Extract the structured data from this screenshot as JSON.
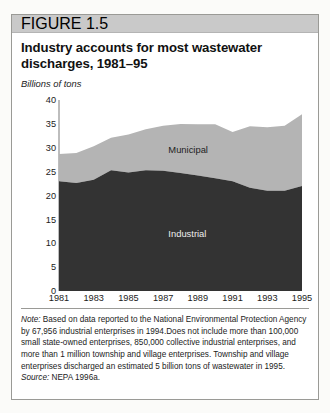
{
  "figure": {
    "band_label": "FIGURE 1.5",
    "title": "Industry accounts for most wastewater discharges, 1981–95",
    "axis_unit": "Billions of tons"
  },
  "footnote": {
    "note_label": "Note:",
    "note_text": " Based on data reported to the National Environmental Protection Agency by 67,956 industrial enterprises in 1994.Does not include more than 100,000 small state-owned enterprises, 850,000 collective industrial enterprises, and more than 1 million township and village enterprises. Township and village enterprises discharged an estimated 5 billion tons of wastewater in 1995.",
    "source_label": "Source:",
    "source_text": " NEPA 1996a."
  },
  "colors": {
    "industrial": "#333333",
    "municipal": "#b4b4b4",
    "band": "#c9c9c9",
    "axis": "#bdbdbd",
    "border": "#9a9a96"
  },
  "chart_data": {
    "type": "area",
    "stacked": true,
    "title": "Industry accounts for most wastewater discharges, 1981–95",
    "xlabel": "",
    "ylabel": "Billions of tons",
    "ylim": [
      0,
      40
    ],
    "yticks": [
      0,
      5,
      10,
      15,
      20,
      25,
      30,
      35,
      40
    ],
    "xlim": [
      1981,
      1995
    ],
    "xticks": [
      1981,
      1983,
      1985,
      1987,
      1989,
      1991,
      1993,
      1995
    ],
    "x": [
      1981,
      1982,
      1983,
      1984,
      1985,
      1986,
      1987,
      1988,
      1989,
      1990,
      1991,
      1992,
      1993,
      1994,
      1995
    ],
    "grid": false,
    "legend_position": "inline",
    "series": [
      {
        "name": "Industrial",
        "color": "#333333",
        "values": [
          23.0,
          22.6,
          23.3,
          25.3,
          24.8,
          25.3,
          25.2,
          24.7,
          24.2,
          23.6,
          23.0,
          21.6,
          21.0,
          21.0,
          22.0
        ]
      },
      {
        "name": "Municipal",
        "color": "#b4b4b4",
        "values": [
          5.7,
          6.3,
          7.0,
          6.8,
          8.0,
          8.6,
          9.4,
          10.3,
          10.7,
          11.3,
          10.3,
          12.9,
          13.3,
          13.6,
          15.0
        ]
      }
    ],
    "totals": [
      28.7,
      28.9,
      30.3,
      32.1,
      32.8,
      33.9,
      34.6,
      35.0,
      34.9,
      34.9,
      33.3,
      34.5,
      34.3,
      34.6,
      37.0
    ],
    "annotations": [
      {
        "text": "Municipal",
        "x": 1987.3,
        "y": 29.5
      },
      {
        "text": "Industrial",
        "x": 1987.3,
        "y": 12.0
      }
    ]
  }
}
